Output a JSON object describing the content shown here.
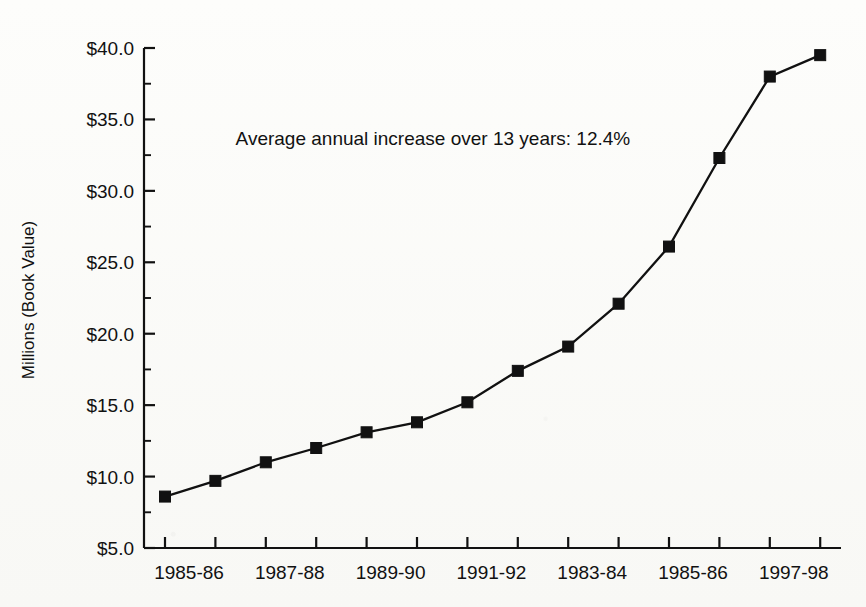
{
  "chart_data": {
    "type": "line",
    "title": "",
    "xlabel": "",
    "ylabel": "Millions (Book Value)",
    "ylim": [
      5.0,
      40.0
    ],
    "y_major_step": 5.0,
    "y_minor_step": 2.5,
    "grid": false,
    "legend": "none",
    "marker": "filled-square",
    "line_color": "#111111",
    "marker_color": "#111111",
    "background_color": "#fbfbf9",
    "y_tick_labels": [
      "$5.0",
      "$10.0",
      "$15.0",
      "$20.0",
      "$25.0",
      "$30.0",
      "$35.0",
      "$40.0"
    ],
    "y_tick_values": [
      5.0,
      10.0,
      15.0,
      20.0,
      25.0,
      30.0,
      35.0,
      40.0
    ],
    "x_tick_count": 14,
    "x_tick_labels": [
      "1985-86",
      "",
      "1987-88",
      "",
      "1989-90",
      "",
      "1991-92",
      "",
      "1983-84",
      "",
      "1985-86",
      "",
      "1997-98",
      ""
    ],
    "categories": [
      "1985-86",
      "1986-87",
      "1987-88",
      "1988-89",
      "1989-90",
      "1990-91",
      "1991-92",
      "1992-93",
      "1983-84",
      "1994-95",
      "1985-86",
      "1996-97",
      "1997-98",
      "1998-99"
    ],
    "values": [
      8.6,
      9.7,
      11.0,
      12.0,
      13.1,
      13.8,
      15.2,
      17.4,
      19.1,
      22.1,
      26.1,
      32.3,
      38.0,
      39.5
    ],
    "annotations": [
      {
        "text": "Average annual increase over 13 years: 12.4%",
        "x_value": 1.4,
        "y_value": 33.2
      }
    ]
  },
  "annotation": {
    "average_increase_note": "Average annual increase over 13 years: 12.4%"
  },
  "axis": {
    "y_title": "Millions (Book Value)"
  }
}
